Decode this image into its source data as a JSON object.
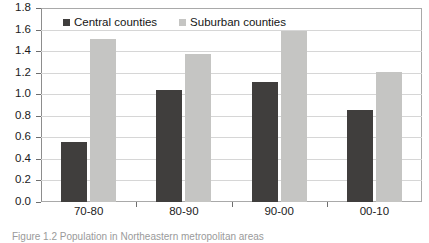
{
  "chart_data": {
    "type": "bar",
    "title": "",
    "xlabel": "",
    "ylabel": "",
    "categories": [
      "70-80",
      "80-90",
      "90-00",
      "00-10"
    ],
    "series": [
      {
        "name": "Central counties",
        "color": "#403e3d",
        "values": [
          0.56,
          1.04,
          1.11,
          0.85
        ]
      },
      {
        "name": "Suburban counties",
        "color": "#c5c5c3",
        "values": [
          1.51,
          1.37,
          1.59,
          1.21
        ]
      }
    ],
    "ylim": [
      0.0,
      1.8
    ],
    "ytick_step": 0.2,
    "ytick_labels": [
      "0.0",
      "0.2",
      "0.4",
      "0.6",
      "0.8",
      "1.0",
      "1.2",
      "1.4",
      "1.6",
      "1.8"
    ],
    "grid": true,
    "legend_position": "top-left-inside"
  },
  "legend": {
    "entries": [
      {
        "label": "Central counties",
        "swatch": "central"
      },
      {
        "label": "Suburban counties",
        "swatch": "suburban"
      }
    ]
  },
  "caption": {
    "text": "Figure 1.2 Population in Northeastern metropolitan areas"
  }
}
